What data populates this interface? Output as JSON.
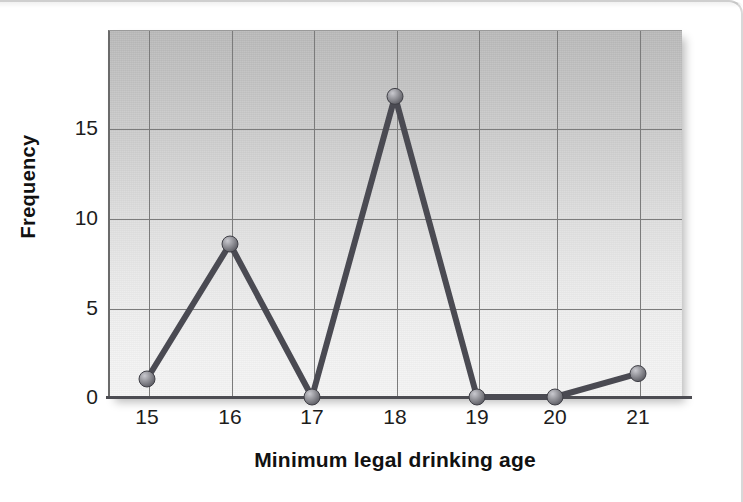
{
  "figure": {
    "kind": "frequency-polygon"
  },
  "axes": {
    "ylabel": "Frequency",
    "xlabel": "Minimum legal drinking age",
    "yticks": [
      "0",
      "5",
      "10",
      "15"
    ],
    "xticks": [
      "15",
      "16",
      "17",
      "18",
      "19",
      "20",
      "21"
    ]
  },
  "colors": {
    "line": "#4a4a52",
    "marker_fill": "#8e8e94",
    "marker_edge": "#3f3f46",
    "gridline": "#7b7b7b",
    "axis": "#4c4c52",
    "plot_bg_top": "#b9b9b9",
    "plot_bg_bottom": "#f4f4f4",
    "text": "#111111"
  },
  "chart_data": {
    "type": "line",
    "title": "",
    "subtitle": "",
    "xlabel": "Minimum legal drinking age",
    "ylabel": "Frequency",
    "categories": [
      15,
      16,
      17,
      18,
      19,
      20,
      21
    ],
    "x": [
      15,
      16,
      17,
      18,
      19,
      20,
      21
    ],
    "values": [
      1,
      8.5,
      0,
      16.7,
      0,
      0,
      1.3
    ],
    "series": [
      {
        "name": "Frequency",
        "values": [
          1,
          8.5,
          0,
          16.7,
          0,
          0,
          1.3
        ]
      }
    ],
    "xlim": [
      14.5,
      21.5
    ],
    "ylim": [
      0,
      20.4
    ],
    "ytick_values": [
      0,
      5,
      10,
      15
    ],
    "xtick_values": [
      15,
      16,
      17,
      18,
      19,
      20,
      21
    ],
    "grid": true,
    "grid_axes": "both",
    "legend": false,
    "legend_position": "none",
    "markers": true,
    "marker_style": "sphere",
    "annotations": []
  }
}
